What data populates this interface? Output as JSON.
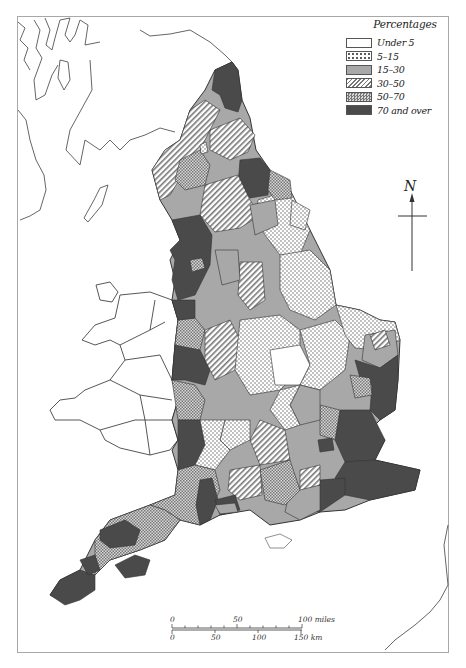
{
  "legend": {
    "title": "Percentages",
    "items": [
      {
        "label": "Under 5",
        "pattern": "white"
      },
      {
        "label": "5–15",
        "pattern": "dots"
      },
      {
        "label": "15–30",
        "pattern": "grey"
      },
      {
        "label": "30–50",
        "pattern": "hatch"
      },
      {
        "label": "50–70",
        "pattern": "crosshatch"
      },
      {
        "label": "70 and over",
        "pattern": "dark"
      }
    ]
  },
  "north_arrow": {
    "label": "N"
  },
  "scale_bar": {
    "miles": {
      "ticks": [
        "0",
        "50",
        "100 miles"
      ]
    },
    "km": {
      "ticks": [
        "0",
        "50",
        "100",
        "150 km"
      ]
    }
  },
  "colors": {
    "dark": "#4a4a4a",
    "grey": "#a8a8a8",
    "outline": "#3a3a3a",
    "frame": "#a8a8a8"
  }
}
